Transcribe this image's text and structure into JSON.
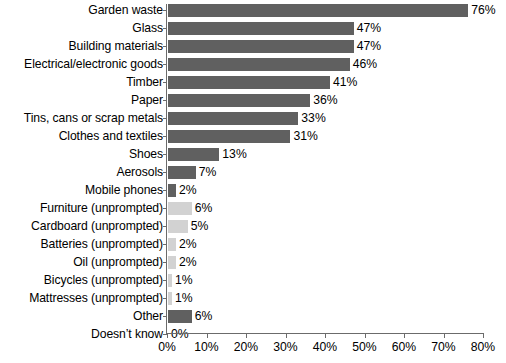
{
  "chart_data": {
    "type": "bar",
    "orientation": "horizontal",
    "title": "",
    "subtitle": "",
    "xlabel": "",
    "ylabel": "",
    "xlim": [
      0,
      80
    ],
    "grid": false,
    "legend": null,
    "xticks": [
      "0%",
      "10%",
      "20%",
      "30%",
      "40%",
      "50%",
      "60%",
      "70%",
      "80%"
    ],
    "xtick_values": [
      0,
      10,
      20,
      30,
      40,
      50,
      60,
      70,
      80
    ],
    "categories": [
      "Garden waste",
      "Glass",
      "Building materials",
      "Electrical/electronic goods",
      "Timber",
      "Paper",
      "Tins, cans or scrap metals",
      "Clothes and textiles",
      "Shoes",
      "Aerosols",
      "Mobile phones",
      "Furniture (unprompted)",
      "Cardboard (unprompted)",
      "Batteries (unprompted)",
      "Oil (unprompted)",
      "Bicycles (unprompted)",
      "Mattresses (unprompted)",
      "Other",
      "Doesn’t know"
    ],
    "values": [
      76,
      47,
      47,
      46,
      41,
      36,
      33,
      31,
      13,
      7,
      2,
      6,
      5,
      2,
      2,
      1,
      1,
      6,
      0
    ],
    "value_labels": [
      "76%",
      "47%",
      "47%",
      "46%",
      "41%",
      "36%",
      "33%",
      "31%",
      "13%",
      "7%",
      "2%",
      "6%",
      "5%",
      "2%",
      "2%",
      "1%",
      "1%",
      "6%",
      "0%"
    ],
    "bar_styles": [
      "dark",
      "dark",
      "dark",
      "dark",
      "dark",
      "dark",
      "dark",
      "dark",
      "dark",
      "dark",
      "dark",
      "light",
      "light",
      "light",
      "light",
      "light",
      "light",
      "dark",
      "dark"
    ],
    "colors": {
      "dark": "#606060",
      "light": "#d2d2d2",
      "axis": "#6b6b6b",
      "text": "#000000",
      "background": "#ffffff"
    }
  }
}
